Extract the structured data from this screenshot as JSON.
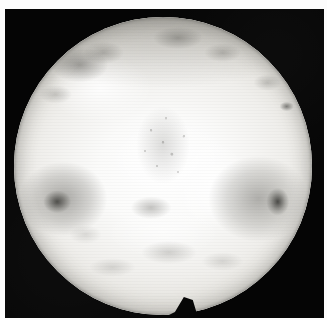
{
  "image": {
    "kind": "grayscale-astronomical-photograph",
    "subject": "illuminated spherical body",
    "caption": "",
    "background_color": "#050505",
    "page_color": "#fcfcfc",
    "body_highlight_color": "#ffffff",
    "body_midtone_color": "#e6e4df",
    "body_shadow_color": "#6a6964",
    "features": [
      {
        "name": "upper-left-dark-patch",
        "tone": "dark-grey"
      },
      {
        "name": "upper-limb-dark-band",
        "tone": "medium-grey"
      },
      {
        "name": "central-speckled-terrain",
        "tone": "mottled-grey"
      },
      {
        "name": "left-vortex-dark-spot",
        "tone": "near-black"
      },
      {
        "name": "right-vortex-dark-spot",
        "tone": "near-black"
      },
      {
        "name": "right-limb-dark-streak",
        "tone": "dark-grey"
      },
      {
        "name": "lower-grey-mottling",
        "tone": "light-grey"
      },
      {
        "name": "bottom-notch-wedge",
        "tone": "black"
      }
    ],
    "frame": {
      "width": 327,
      "height": 320
    }
  }
}
